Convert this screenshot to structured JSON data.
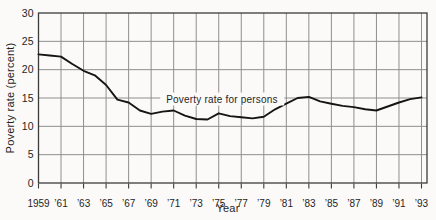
{
  "chart_data": {
    "type": "line",
    "title": "",
    "xlabel": "Year",
    "ylabel": "Poverty rate (percent)",
    "annotation": "Poverty rate for persons",
    "series_name": "Poverty rate for persons",
    "x": [
      1959,
      1960,
      1961,
      1962,
      1963,
      1964,
      1965,
      1966,
      1967,
      1968,
      1969,
      1970,
      1971,
      1972,
      1973,
      1974,
      1975,
      1976,
      1977,
      1978,
      1979,
      1980,
      1981,
      1982,
      1983,
      1984,
      1985,
      1986,
      1987,
      1988,
      1989,
      1990,
      1991,
      1992,
      1993
    ],
    "values": [
      22.7,
      22.5,
      22.3,
      21.0,
      19.8,
      19.0,
      17.3,
      14.7,
      14.2,
      12.8,
      12.2,
      12.6,
      12.8,
      11.9,
      11.3,
      11.2,
      12.3,
      11.8,
      11.6,
      11.4,
      11.7,
      13.0,
      14.0,
      15.0,
      15.2,
      14.4,
      14.0,
      13.6,
      13.4,
      13.0,
      12.8,
      13.5,
      14.2,
      14.8,
      15.1
    ],
    "xlim": [
      1959,
      1993
    ],
    "ylim": [
      0,
      30
    ],
    "y_ticks": [
      0,
      5,
      10,
      15,
      20,
      25,
      30
    ],
    "x_tick_years": [
      1959,
      1961,
      1963,
      1965,
      1967,
      1969,
      1971,
      1973,
      1975,
      1977,
      1979,
      1981,
      1983,
      1985,
      1987,
      1989,
      1991,
      1993
    ],
    "x_tick_labels": [
      "1959",
      "’61",
      "’63",
      "’65",
      "’67",
      "’69",
      "’71",
      "’73",
      "’75",
      "’77",
      "’79",
      "’81",
      "’83",
      "’85",
      "’87",
      "’89",
      "’91",
      "’93"
    ],
    "grid": true,
    "legend_position": "none",
    "line_color": "#151515",
    "grid_color": "#8f8f8f",
    "border_color": "#3c3c3c",
    "background": "#fbfaf8"
  }
}
